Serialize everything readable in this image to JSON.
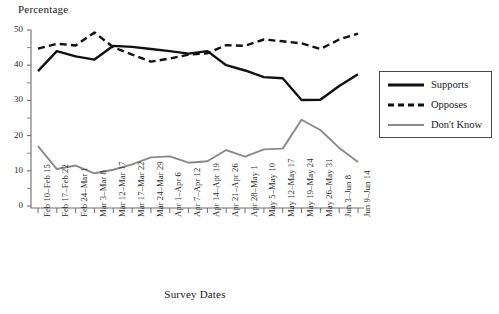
{
  "chart_data": {
    "type": "line",
    "title": "",
    "xlabel": "Survey Dates",
    "ylabel": "Percentage",
    "ylim": [
      0,
      50
    ],
    "yticks": [
      0,
      10,
      20,
      30,
      40,
      50
    ],
    "yminorticks": [
      5,
      15,
      25,
      35,
      45
    ],
    "grid": false,
    "legend_position": "right",
    "categories": [
      "Feb 10–Feb 15",
      "Feb 17–Feb 22",
      "Feb 24–Mar 1",
      "Mar 3–Mar 8",
      "Mar 12–Mar 17",
      "Mar 17–Mar 22",
      "Mar 24–Mar 29",
      "Apr 1–Apr 6",
      "Apr 7–Apr 12",
      "Apr 14–Apr 19",
      "Apr 21–Apr 26",
      "Apr 28–May 1",
      "May 5–May 10",
      "May 12–May 17",
      "May 19–May 24",
      "May 26–May 31",
      "Jun 3–Jun 8",
      "Jun 9–Jun 14"
    ],
    "series": [
      {
        "name": "Supports",
        "color": "#111111",
        "style": "solid",
        "values": [
          38.3,
          44.0,
          42.5,
          41.6,
          45.5,
          45.2,
          44.6,
          44.0,
          43.3,
          44.0,
          40.0,
          38.5,
          36.6,
          36.3,
          30.1,
          30.2,
          34.1,
          37.4
        ]
      },
      {
        "name": "Opposes",
        "color": "#111111",
        "style": "dashed",
        "values": [
          44.7,
          46.1,
          45.6,
          49.3,
          45.1,
          43.0,
          41.0,
          41.9,
          43.0,
          43.4,
          45.7,
          45.5,
          47.3,
          46.8,
          46.2,
          44.6,
          47.3,
          49.0
        ]
      },
      {
        "name": "Don't Know",
        "color": "#8a8a8a",
        "style": "solid",
        "values": [
          17.0,
          10.5,
          11.5,
          9.3,
          10.3,
          11.8,
          13.8,
          14.1,
          12.3,
          12.7,
          15.9,
          14.0,
          16.1,
          16.3,
          24.5,
          21.6,
          16.5,
          12.5
        ]
      }
    ]
  },
  "legend": {
    "items": [
      {
        "label": "Supports"
      },
      {
        "label": "Opposes"
      },
      {
        "label": "Don't Know"
      }
    ]
  }
}
